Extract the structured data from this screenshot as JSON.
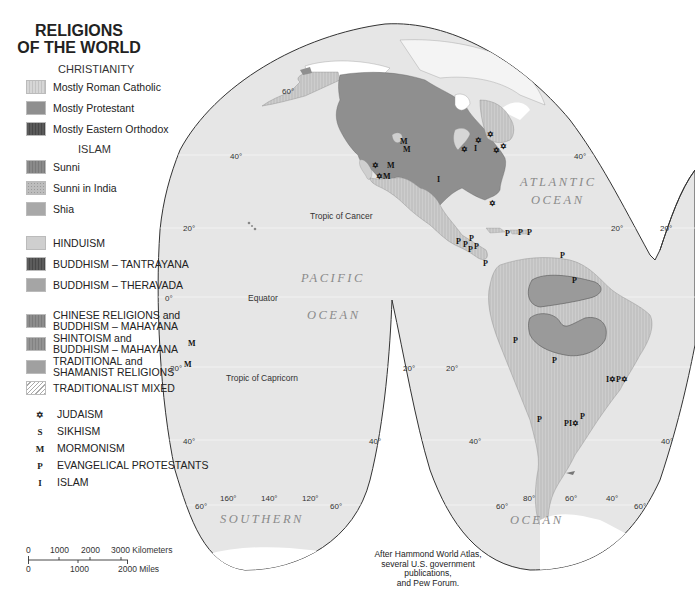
{
  "title_line1": "RELIGIONS",
  "title_line2": "OF THE WORLD",
  "legend": {
    "christianity_header": "CHRISTIANITY",
    "islam_header": "ISLAM",
    "items": [
      {
        "label": "Mostly Roman Catholic",
        "color": "#d6d6d6",
        "pattern": "vlines"
      },
      {
        "label": "Mostly Protestant",
        "color": "#8f8f8f",
        "pattern": "solid"
      },
      {
        "label": "Mostly Eastern Orthodox",
        "color": "#5a5a5a",
        "pattern": "vlines"
      },
      {
        "label": "Sunni",
        "color": "#8a8a8a",
        "pattern": "vlines"
      },
      {
        "label": "Sunni in India",
        "color": "#b5b5b5",
        "pattern": "dots"
      },
      {
        "label": "Shia",
        "color": "#a8a8a8",
        "pattern": "solid"
      },
      {
        "label": "HINDUISM",
        "color": "#cfcfcf",
        "pattern": "solid"
      },
      {
        "label": "BUDDHISM – TANTRAYANA",
        "color": "#5c5c5c",
        "pattern": "vlines"
      },
      {
        "label": "BUDDHISM – THERAVADA",
        "color": "#a5a5a5",
        "pattern": "solid"
      },
      {
        "label_line1": "CHINESE RELIGIONS and",
        "label_line2": "BUDDHISM – MAHAYANA",
        "color": "#8d8d8d",
        "pattern": "vlines"
      },
      {
        "label_line1": "SHINTOISM and",
        "label_line2": "BUDDHISM – MAHAYANA",
        "color": "#939393",
        "pattern": "vlines"
      },
      {
        "label_line1": "TRADITIONAL and",
        "label_line2": "SHAMANIST RELIGIONS",
        "color": "#a0a0a0",
        "pattern": "solid"
      },
      {
        "label": "TRADITIONALIST MIXED",
        "color": "#ffffff",
        "pattern": "diag"
      }
    ],
    "symbols": [
      {
        "glyph": "✡",
        "label": "JUDAISM"
      },
      {
        "glyph": "S",
        "label": "SIKHISM"
      },
      {
        "glyph": "M",
        "label": "MORMONISM"
      },
      {
        "glyph": "P",
        "label": "EVANGELICAL PROTESTANTS"
      },
      {
        "glyph": "I",
        "label": "ISLAM"
      }
    ]
  },
  "scale_bar": {
    "km_ticks": [
      "0",
      "1000",
      "2000",
      "3000 Kilometers"
    ],
    "mile_ticks": [
      "0",
      "1000",
      "2000 Miles"
    ]
  },
  "map": {
    "ocean_labels": [
      "PACIFIC",
      "OCEAN",
      "ATLANTIC",
      "OCEAN",
      "SOUTHERN",
      "OCEAN"
    ],
    "lines": {
      "tropic_cancer": "Tropic of Cancer",
      "equator": "Equator",
      "tropic_capricorn": "Tropic of Capricorn"
    },
    "degree_labels": {
      "lat_60": "60°",
      "lat_40": "40°",
      "lat_20": "20°",
      "lat_0": "0°",
      "lon_160": "160°",
      "lon_140": "140°",
      "lon_120": "120°",
      "lon_80": "80°",
      "lon_60": "60°",
      "lon_40": "40°"
    },
    "markers": {
      "M": "M",
      "P": "P",
      "I": "I",
      "J": "✡",
      "RM": "✡M",
      "PI": "PI✡",
      "IP": "I✡P✡"
    }
  },
  "credit_lines": [
    "After Hammond World Atlas,",
    "several U.S. government publications,",
    "and Pew Forum."
  ],
  "colors": {
    "ocean": "#e6e6e6",
    "land_protestant": "#8f8f8f",
    "land_catholic": "#cfcfcf",
    "ice": "#ffffff",
    "outline": "#333333"
  }
}
